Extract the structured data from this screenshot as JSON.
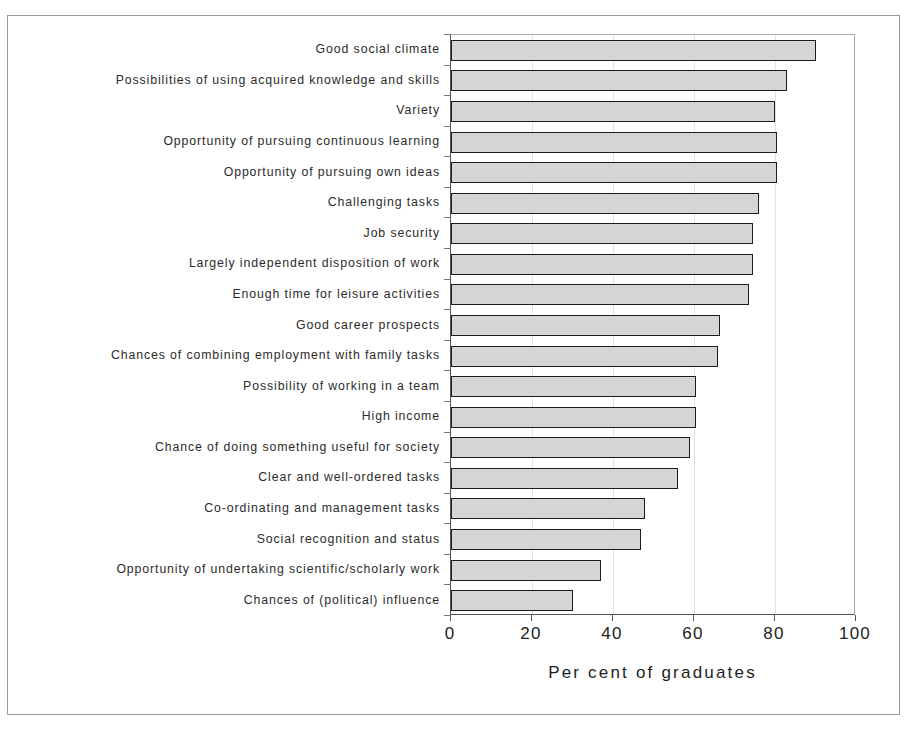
{
  "chart_data": {
    "type": "bar",
    "orientation": "horizontal",
    "title": "",
    "xlabel": "Per cent of graduates",
    "ylabel": "",
    "xlim": [
      0,
      100
    ],
    "xticks": [
      0,
      20,
      40,
      60,
      80,
      100
    ],
    "xtick_labels": [
      "0",
      "20",
      "40",
      "60",
      "80",
      "100"
    ],
    "gridlines": [
      20,
      40,
      60,
      80
    ],
    "grid": true,
    "legend": null,
    "bar_fill_color": "#d5d5d5",
    "bar_edge_color": "#1c1c1c",
    "categories": [
      "Good social climate",
      "Possibilities of using acquired knowledge and skills",
      "Variety",
      "Opportunity of pursuing continuous learning",
      "Opportunity of pursuing own ideas",
      "Challenging tasks",
      "Job security",
      "Largely independent disposition of work",
      "Enough time for leisure activities",
      "Good career prospects",
      "Chances of combining employment with family tasks",
      "Possibility of working in a team",
      "High income",
      "Chance of doing something useful for society",
      "Clear and well-ordered tasks",
      "Co-ordinating and management tasks",
      "Social recognition and status",
      "Opportunity of undertaking scientific/scholarly work",
      "Chances of (political) influence"
    ],
    "values": [
      90,
      83,
      80,
      80.5,
      80.5,
      76,
      74.5,
      74.5,
      73.5,
      66.5,
      66,
      60.5,
      60.5,
      59,
      56,
      48,
      47,
      37,
      30
    ]
  }
}
